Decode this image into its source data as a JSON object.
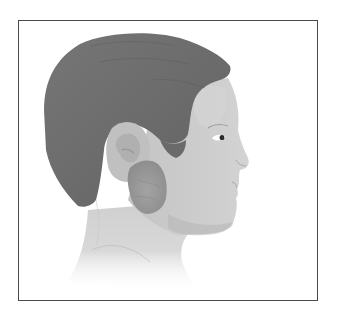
{
  "figure": {
    "description": "Medical illustration: side profile of a male head facing right, showing a swollen parotid gland below and in front of the ear",
    "highlight": "swollen-parotid-gland"
  },
  "colors": {
    "frame_border": "#4a4a4a",
    "background": "#ffffff",
    "hair": "#6e6e6e",
    "hair_shadow": "#5c5c5c",
    "skin_face": "#c9c9c9",
    "skin_light": "#d8d8d8",
    "skin_shadow": "#b3b3b3",
    "ear": "#bdbdbd",
    "ear_inner": "#a9a9a9",
    "gland": "#9c9c9c",
    "gland_dark": "#8a8a8a",
    "neck": "#d4d4d4",
    "eye": "#2a2a2a"
  }
}
